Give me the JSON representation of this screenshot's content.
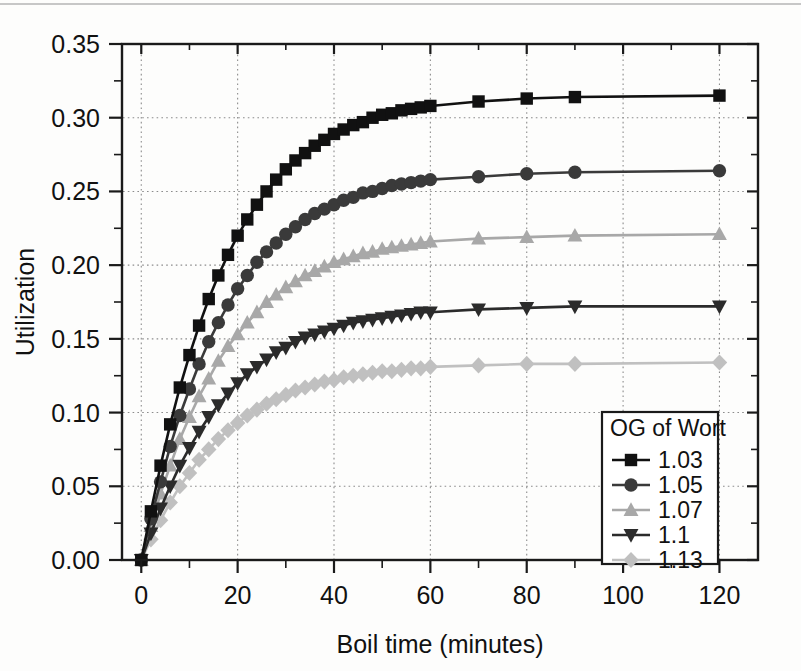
{
  "figure": {
    "kind": "scientific-line-chart",
    "background": "#ffffff"
  },
  "chart_data": {
    "type": "line",
    "title": "",
    "subtitle": "",
    "xlabel": "Boil time (minutes)",
    "ylabel": "Utilization",
    "xlim": [
      -4,
      128
    ],
    "ylim": [
      0.0,
      0.35
    ],
    "xticks": [
      0,
      20,
      40,
      60,
      80,
      100,
      120
    ],
    "xtick_labels": [
      "0",
      "20",
      "40",
      "60",
      "80",
      "100",
      "120"
    ],
    "yticks": [
      0.0,
      0.05,
      0.1,
      0.15,
      0.2,
      0.25,
      0.3,
      0.35
    ],
    "ytick_labels": [
      "0.00",
      "0.05",
      "0.10",
      "0.15",
      "0.20",
      "0.25",
      "0.30",
      "0.35"
    ],
    "x_minor_tick_step": 10,
    "y_minor_tick_step": 0.025,
    "grid": true,
    "grid_style": "dotted",
    "grid_color": "#8c8c8c",
    "legend_position": "bottom-right",
    "legend_title": "OG of Wort",
    "x": [
      0,
      2,
      4,
      6,
      8,
      10,
      12,
      14,
      16,
      18,
      20,
      22,
      24,
      26,
      28,
      30,
      32,
      34,
      36,
      38,
      40,
      42,
      44,
      46,
      48,
      50,
      52,
      54,
      56,
      58,
      60,
      70,
      80,
      90,
      120
    ],
    "series": [
      {
        "name": "1.03",
        "marker": "square",
        "color": "#111111",
        "line_color": "#111111",
        "values": [
          0.0,
          0.033,
          0.064,
          0.092,
          0.117,
          0.139,
          0.159,
          0.177,
          0.193,
          0.207,
          0.22,
          0.231,
          0.241,
          0.25,
          0.258,
          0.265,
          0.271,
          0.276,
          0.281,
          0.285,
          0.289,
          0.292,
          0.295,
          0.297,
          0.3,
          0.302,
          0.303,
          0.305,
          0.306,
          0.307,
          0.308,
          0.311,
          0.313,
          0.314,
          0.315
        ]
      },
      {
        "name": "1.05",
        "marker": "circle",
        "color": "#3a3a3a",
        "line_color": "#3a3a3a",
        "values": [
          0.0,
          0.028,
          0.053,
          0.077,
          0.098,
          0.116,
          0.133,
          0.148,
          0.161,
          0.173,
          0.184,
          0.193,
          0.202,
          0.209,
          0.215,
          0.221,
          0.226,
          0.231,
          0.235,
          0.238,
          0.241,
          0.244,
          0.246,
          0.249,
          0.25,
          0.252,
          0.254,
          0.255,
          0.256,
          0.257,
          0.258,
          0.26,
          0.262,
          0.263,
          0.264
        ]
      },
      {
        "name": "1.07",
        "marker": "triangle-up",
        "color": "#a8a8a8",
        "line_color": "#a8a8a8",
        "values": [
          0.0,
          0.023,
          0.045,
          0.064,
          0.082,
          0.097,
          0.111,
          0.123,
          0.135,
          0.145,
          0.153,
          0.161,
          0.168,
          0.175,
          0.18,
          0.185,
          0.189,
          0.193,
          0.196,
          0.199,
          0.202,
          0.204,
          0.206,
          0.208,
          0.209,
          0.211,
          0.212,
          0.213,
          0.214,
          0.215,
          0.216,
          0.218,
          0.219,
          0.22,
          0.221
        ]
      },
      {
        "name": "1.1",
        "marker": "triangle-down",
        "color": "#2b2b2b",
        "line_color": "#2b2b2b",
        "values": [
          0.0,
          0.018,
          0.035,
          0.05,
          0.064,
          0.076,
          0.087,
          0.097,
          0.105,
          0.113,
          0.12,
          0.126,
          0.131,
          0.136,
          0.141,
          0.144,
          0.148,
          0.151,
          0.153,
          0.155,
          0.157,
          0.159,
          0.161,
          0.162,
          0.163,
          0.164,
          0.165,
          0.166,
          0.167,
          0.168,
          0.168,
          0.17,
          0.171,
          0.172,
          0.172
        ]
      },
      {
        "name": "1.13",
        "marker": "diamond",
        "color": "#c0c0c0",
        "line_color": "#c0c0c0",
        "values": [
          0.0,
          0.014,
          0.027,
          0.039,
          0.05,
          0.059,
          0.068,
          0.075,
          0.082,
          0.088,
          0.093,
          0.098,
          0.102,
          0.106,
          0.109,
          0.112,
          0.115,
          0.117,
          0.119,
          0.121,
          0.122,
          0.124,
          0.125,
          0.126,
          0.127,
          0.128,
          0.128,
          0.129,
          0.13,
          0.13,
          0.131,
          0.132,
          0.133,
          0.133,
          0.134
        ]
      }
    ],
    "annotations": []
  },
  "legend": {
    "title": "OG of Wort",
    "entries": [
      {
        "label": "1.03",
        "marker": "square",
        "color": "#111111"
      },
      {
        "label": "1.05",
        "marker": "circle",
        "color": "#3a3a3a"
      },
      {
        "label": "1.07",
        "marker": "triangle-up",
        "color": "#a8a8a8"
      },
      {
        "label": "1.1",
        "marker": "triangle-down",
        "color": "#2b2b2b"
      },
      {
        "label": "1.13",
        "marker": "diamond",
        "color": "#c0c0c0"
      }
    ]
  },
  "axes": {
    "x_title": "Boil time (minutes)",
    "y_title": "Utilization"
  }
}
